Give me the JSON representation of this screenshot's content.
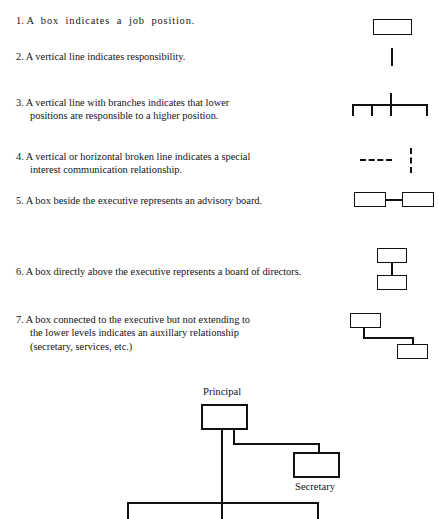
{
  "page": {
    "width": 438,
    "height": 519,
    "background": "#ffffff",
    "ink_color": "#111111"
  },
  "legend": {
    "items": [
      {
        "number": "1.",
        "text": "A  box  indicates  a  job  position.",
        "lines": [
          "A  box  indicates  a  job  position."
        ],
        "symbol": "single-box"
      },
      {
        "number": "2.",
        "text": "A vertical line indicates responsibility.",
        "lines": [
          "A vertical line indicates responsibility."
        ],
        "symbol": "vertical-line"
      },
      {
        "number": "3.",
        "text": "A vertical line with branches indicates that lower positions are responsible to a higher position.",
        "lines": [
          "A vertical line with branches indicates that lower",
          "positions are responsible to a higher position."
        ],
        "symbol": "branch-comb"
      },
      {
        "number": "4.",
        "text": "A vertical or horizontal broken line indicates a special interest communication relationship.",
        "lines": [
          "A vertical or horizontal broken line indicates a special",
          "interest communication relationship."
        ],
        "symbol": "broken-lines"
      },
      {
        "number": "5.",
        "text": "A box beside the executive represents an advisory board.",
        "lines": [
          "A box beside the executive represents an advisory board."
        ],
        "symbol": "side-by-side-boxes"
      },
      {
        "number": "6.",
        "text": "A box directly above the executive represents a board of directors.",
        "lines": [
          "A box directly above the executive represents a board of directors."
        ],
        "symbol": "stacked-boxes"
      },
      {
        "number": "7.",
        "text": "A box connected to the executive but not extending to the lower levels indicates an auxillary relationship (secretary, services, etc.)",
        "lines": [
          "A box connected to the executive but not extending to",
          "the lower levels indicates an auxillary relationship",
          "(secretary, services, etc.)"
        ],
        "symbol": "auxiliary-offset-boxes"
      }
    ]
  },
  "org_chart": {
    "nodes": [
      {
        "id": "principal",
        "label": "Principal",
        "label_position": "above"
      },
      {
        "id": "secretary",
        "label": "Secretary",
        "label_position": "below"
      }
    ],
    "connections": [
      "principal-down-trunk",
      "principal-to-secretary-elbow",
      "trunk-to-level-bar",
      "level-bar-left-drop",
      "level-bar-center-drop",
      "level-bar-right-drop"
    ]
  }
}
